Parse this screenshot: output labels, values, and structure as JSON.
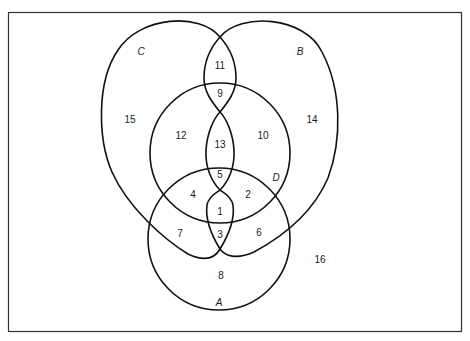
{
  "diagram": {
    "type": "venn",
    "sets": [
      {
        "name": "A",
        "label": "A"
      },
      {
        "name": "B",
        "label": "B"
      },
      {
        "name": "C",
        "label": "C"
      },
      {
        "name": "D",
        "label": "D"
      }
    ],
    "regions": [
      {
        "id": "r1",
        "label": "1"
      },
      {
        "id": "r2",
        "label": "2"
      },
      {
        "id": "r3",
        "label": "3"
      },
      {
        "id": "r4",
        "label": "4"
      },
      {
        "id": "r5",
        "label": "5"
      },
      {
        "id": "r6",
        "label": "6"
      },
      {
        "id": "r7",
        "label": "7"
      },
      {
        "id": "r8",
        "label": "8"
      },
      {
        "id": "r9",
        "label": "9"
      },
      {
        "id": "r10",
        "label": "10"
      },
      {
        "id": "r11",
        "label": "11"
      },
      {
        "id": "r12",
        "label": "12"
      },
      {
        "id": "r13",
        "label": "13"
      },
      {
        "id": "r14",
        "label": "14"
      },
      {
        "id": "r15",
        "label": "15"
      },
      {
        "id": "r16",
        "label": "16"
      }
    ],
    "colors": {
      "stroke": "#111111",
      "background": "#ffffff",
      "text": "#1a1a1a"
    }
  }
}
